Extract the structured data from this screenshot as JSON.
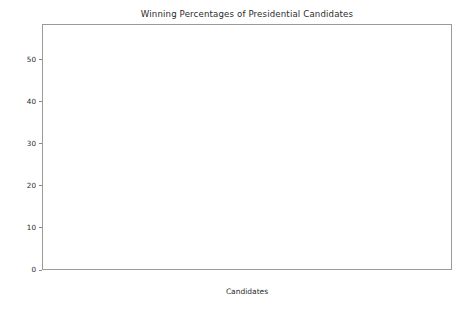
{
  "chart_data": {
    "type": "bar",
    "title": "Winning Percentages of Presidential Candidates",
    "xlabel": "Candidates",
    "ylabel": "Winning Percentages (%)",
    "categories": [
      "Obama",
      "Romney",
      "Johnson",
      "Stein",
      "Paul",
      "Anderson",
      "Reed"
    ],
    "values": [
      56.27,
      40.98,
      1.31,
      1.14,
      0.29,
      0.01,
      0.0
    ],
    "value_labels": [
      "56.27%",
      "40.98%",
      "1.31%",
      "1.14%",
      "0.29%",
      "0.01%",
      "0.00%"
    ],
    "bar_colors": [
      "#3a3a3a",
      "#6b6b6b",
      "#b0b0b0",
      "#5a5a5a",
      "#404040",
      "#4a4a4a",
      "#4a4a4a"
    ],
    "ylim": [
      0,
      58.5
    ],
    "y_ticks": [
      0,
      10,
      20,
      30,
      40,
      50
    ],
    "y_tick_labels": [
      "0",
      "10",
      "20",
      "30",
      "40",
      "50"
    ],
    "grid": false,
    "legend": "none"
  },
  "figure": {
    "background_color": "#ffffff",
    "axes_edge_color": "#9a9a9a",
    "text_color": "#2b2b2b"
  }
}
